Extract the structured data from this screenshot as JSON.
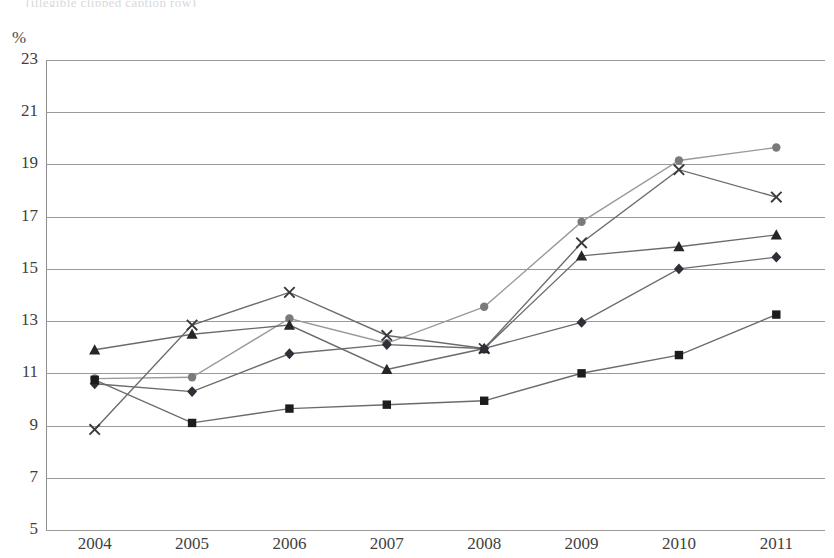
{
  "top_clipped_title": "(illegible clipped caption row)",
  "axis": {
    "y_unit": "%",
    "y_ticks": [
      23,
      21,
      19,
      17,
      15,
      13,
      11,
      9,
      7,
      5
    ],
    "y_min": 5,
    "y_max": 23,
    "x_ticks": [
      "2004",
      "2005",
      "2006",
      "2007",
      "2008",
      "2009",
      "2010",
      "2011"
    ]
  },
  "chart_data": {
    "type": "line",
    "title": "",
    "xlabel": "",
    "ylabel": "%",
    "ylim": [
      5,
      23
    ],
    "ytick_step": 2,
    "grid": true,
    "legend": "none",
    "x": [
      "2004",
      "2005",
      "2006",
      "2007",
      "2008",
      "2009",
      "2010",
      "2011"
    ],
    "series": [
      {
        "name": "series-circle-gray",
        "marker": "circle",
        "color": "#7a7a7a",
        "line_color": "#9a9a9a",
        "line_style": "solid",
        "values": [
          10.8,
          10.85,
          13.1,
          12.15,
          13.55,
          16.8,
          19.15,
          19.65
        ]
      },
      {
        "name": "series-cross-dark",
        "marker": "x",
        "color": "#3a3a3a",
        "line_color": "#6b6b6b",
        "line_style": "solid",
        "values": [
          8.85,
          12.85,
          14.1,
          12.45,
          11.95,
          16.0,
          18.8,
          17.75
        ]
      },
      {
        "name": "series-triangle-black",
        "marker": "triangle",
        "color": "#262626",
        "line_color": "#6b6b6b",
        "line_style": "solid",
        "values": [
          11.9,
          12.5,
          12.85,
          11.15,
          11.95,
          15.5,
          15.85,
          16.3
        ]
      },
      {
        "name": "series-diamond-dark",
        "marker": "diamond",
        "color": "#2f2f38",
        "line_color": "#6b6b6b",
        "line_style": "solid",
        "values": [
          10.6,
          10.3,
          11.75,
          12.1,
          11.95,
          12.95,
          15.0,
          15.45
        ]
      },
      {
        "name": "series-square-black",
        "marker": "square",
        "color": "#1c1c1c",
        "line_color": "#6b6b6b",
        "line_style": "solid",
        "values": [
          10.75,
          9.1,
          9.65,
          9.8,
          9.95,
          11.0,
          11.7,
          13.25
        ]
      }
    ]
  }
}
